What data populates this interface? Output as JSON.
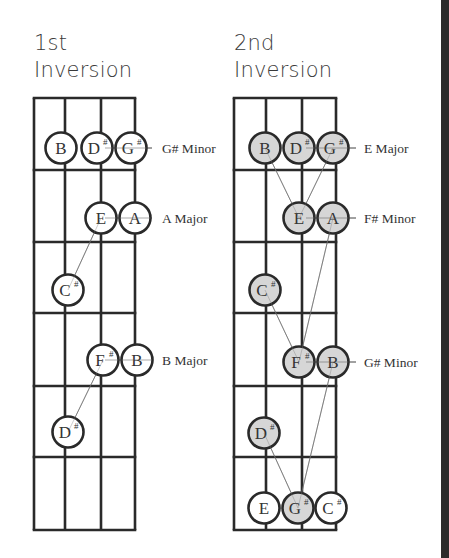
{
  "diagrams": [
    {
      "title_line1": "1st",
      "title_line2": "Inversion",
      "notes": [
        {
          "name": "B",
          "sharp": "",
          "x": 61,
          "y": 148,
          "filled": false
        },
        {
          "name": "D",
          "sharp": "#",
          "x": 97,
          "y": 148,
          "filled": false
        },
        {
          "name": "G",
          "sharp": "#",
          "x": 131,
          "y": 148,
          "filled": false
        },
        {
          "name": "E",
          "sharp": "",
          "x": 101,
          "y": 218,
          "filled": false
        },
        {
          "name": "A",
          "sharp": "",
          "x": 135,
          "y": 218,
          "filled": false
        },
        {
          "name": "C",
          "sharp": "#",
          "x": 68,
          "y": 290,
          "filled": false
        },
        {
          "name": "F",
          "sharp": "#",
          "x": 103,
          "y": 360,
          "filled": false
        },
        {
          "name": "B",
          "sharp": "",
          "x": 137,
          "y": 360,
          "filled": false
        },
        {
          "name": "D",
          "sharp": "#",
          "x": 68,
          "y": 432,
          "filled": false
        }
      ],
      "chord_labels": [
        {
          "text": "G# Minor",
          "y": 148
        },
        {
          "text": "A Major",
          "y": 218
        },
        {
          "text": "B Major",
          "y": 360
        }
      ]
    },
    {
      "title_line1": "2nd",
      "title_line2": "Inversion",
      "notes": [
        {
          "name": "B",
          "sharp": "",
          "x": 265,
          "y": 148,
          "filled": true
        },
        {
          "name": "D",
          "sharp": "#",
          "x": 299,
          "y": 148,
          "filled": true
        },
        {
          "name": "G",
          "sharp": "#",
          "x": 333,
          "y": 148,
          "filled": true
        },
        {
          "name": "E",
          "sharp": "",
          "x": 299,
          "y": 218,
          "filled": true
        },
        {
          "name": "A",
          "sharp": "",
          "x": 333,
          "y": 218,
          "filled": true
        },
        {
          "name": "C",
          "sharp": "#",
          "x": 265,
          "y": 290,
          "filled": true
        },
        {
          "name": "F",
          "sharp": "#",
          "x": 299,
          "y": 362,
          "filled": true
        },
        {
          "name": "B",
          "sharp": "",
          "x": 333,
          "y": 362,
          "filled": true
        },
        {
          "name": "D",
          "sharp": "#",
          "x": 264,
          "y": 433,
          "filled": true
        },
        {
          "name": "E",
          "sharp": "",
          "x": 264,
          "y": 508,
          "filled": false
        },
        {
          "name": "G",
          "sharp": "#",
          "x": 298,
          "y": 508,
          "filled": true
        },
        {
          "name": "C",
          "sharp": "#",
          "x": 331,
          "y": 508,
          "filled": false
        }
      ],
      "chord_labels": [
        {
          "text": "E Major",
          "y": 148
        },
        {
          "text": "F# Minor",
          "y": 218
        },
        {
          "text": "G# Minor",
          "y": 362
        }
      ]
    }
  ],
  "colors": {
    "line": "#2a2a2a",
    "note_fill": "#d6d6d6",
    "note_empty": "#ffffff",
    "text": "#333333",
    "right_edge": "#2b2b2b"
  }
}
